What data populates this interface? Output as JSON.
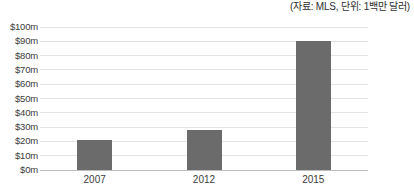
{
  "annotation": {
    "source_note": "(자료: MLS, 단위: 1백만 달러)"
  },
  "chart_data": {
    "type": "bar",
    "title": "",
    "subtitle": "",
    "xlabel": "",
    "ylabel": "",
    "categories": [
      "2007",
      "2012",
      "2015"
    ],
    "values": [
      21,
      28,
      90
    ],
    "ylim": [
      0,
      100
    ],
    "ytick_values": [
      0,
      10,
      20,
      30,
      40,
      50,
      60,
      70,
      80,
      90,
      100
    ],
    "ytick_labels": [
      "$0m",
      "$10m",
      "$20m",
      "$30m",
      "$40m",
      "$50m",
      "$60m",
      "$70m",
      "$80m",
      "$90m",
      "$100m"
    ],
    "series": [
      {
        "name": "",
        "values": [
          21,
          28,
          90
        ],
        "color": "#6b6b6b"
      }
    ],
    "grid": true,
    "grid_axis": "y",
    "legend": false,
    "legend_position": "none",
    "annotations": [
      "(자료: MLS, 단위: 1백만 달러)"
    ],
    "unit": "1백만 달러",
    "source": "MLS"
  },
  "style": {
    "bar_color": "#6b6b6b",
    "gridline_color": "#e3e3e3",
    "axis_color": "#bdbdbd",
    "text_color": "#3c3c3c",
    "background": "#ffffff"
  }
}
